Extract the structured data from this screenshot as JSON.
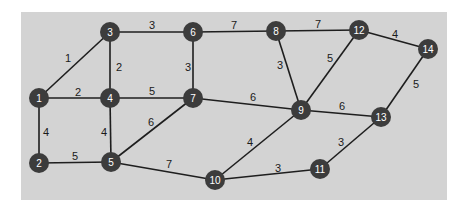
{
  "diagram": {
    "type": "weighted-undirected-graph",
    "colors": {
      "panel": "#d3d3d3",
      "node": "#3c3c3c",
      "node_label": "#ffffff",
      "edge": "#1e1e1e",
      "weight": "#1a1a1a"
    },
    "nodes": [
      {
        "id": "1",
        "x": 39,
        "y": 98
      },
      {
        "id": "2",
        "x": 39,
        "y": 163
      },
      {
        "id": "3",
        "x": 110,
        "y": 32
      },
      {
        "id": "4",
        "x": 110,
        "y": 98
      },
      {
        "id": "5",
        "x": 111,
        "y": 162
      },
      {
        "id": "6",
        "x": 193,
        "y": 32
      },
      {
        "id": "7",
        "x": 193,
        "y": 98
      },
      {
        "id": "8",
        "x": 276,
        "y": 31
      },
      {
        "id": "9",
        "x": 301,
        "y": 110
      },
      {
        "id": "10",
        "x": 215,
        "y": 180
      },
      {
        "id": "11",
        "x": 320,
        "y": 169
      },
      {
        "id": "12",
        "x": 359,
        "y": 30
      },
      {
        "id": "13",
        "x": 381,
        "y": 117
      },
      {
        "id": "14",
        "x": 428,
        "y": 49
      }
    ],
    "edges": [
      {
        "from": "1",
        "to": "3",
        "weight": "1",
        "lx": 68,
        "ly": 58
      },
      {
        "from": "1",
        "to": "4",
        "weight": "2",
        "lx": 78,
        "ly": 92
      },
      {
        "from": "1",
        "to": "2",
        "weight": "4",
        "lx": 46,
        "ly": 132
      },
      {
        "from": "3",
        "to": "6",
        "weight": "3",
        "lx": 152,
        "ly": 25
      },
      {
        "from": "3",
        "to": "4",
        "weight": "2",
        "lx": 119,
        "ly": 67
      },
      {
        "from": "6",
        "to": "7",
        "weight": "3",
        "lx": 188,
        "ly": 67
      },
      {
        "from": "6",
        "to": "8",
        "weight": "7",
        "lx": 234,
        "ly": 25
      },
      {
        "from": "4",
        "to": "7",
        "weight": "5",
        "lx": 152,
        "ly": 91
      },
      {
        "from": "4",
        "to": "5",
        "weight": "4",
        "lx": 104,
        "ly": 132
      },
      {
        "from": "2",
        "to": "5",
        "weight": "5",
        "lx": 75,
        "ly": 156
      },
      {
        "from": "5",
        "to": "7",
        "weight": "6",
        "lx": 151,
        "ly": 122
      },
      {
        "from": "5",
        "to": "10",
        "weight": "7",
        "lx": 169,
        "ly": 164
      },
      {
        "from": "7",
        "to": "9",
        "weight": "6",
        "lx": 253,
        "ly": 97
      },
      {
        "from": "8",
        "to": "12",
        "weight": "7",
        "lx": 318,
        "ly": 24
      },
      {
        "from": "8",
        "to": "9",
        "weight": "3",
        "lx": 280,
        "ly": 65
      },
      {
        "from": "12",
        "to": "9",
        "weight": "5",
        "lx": 330,
        "ly": 58
      },
      {
        "from": "12",
        "to": "14",
        "weight": "4",
        "lx": 395,
        "ly": 34
      },
      {
        "from": "9",
        "to": "13",
        "weight": "6",
        "lx": 342,
        "ly": 106
      },
      {
        "from": "9",
        "to": "10",
        "weight": "4",
        "lx": 250,
        "ly": 142
      },
      {
        "from": "10",
        "to": "11",
        "weight": "3",
        "lx": 278,
        "ly": 168
      },
      {
        "from": "11",
        "to": "13",
        "weight": "3",
        "lx": 341,
        "ly": 142
      },
      {
        "from": "14",
        "to": "13",
        "weight": "5",
        "lx": 416,
        "ly": 84
      }
    ]
  }
}
